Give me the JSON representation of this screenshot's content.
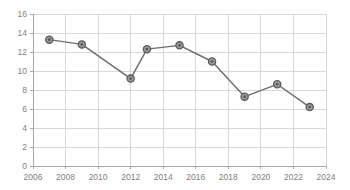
{
  "chart_data": {
    "type": "line",
    "title": "",
    "subtitle": "",
    "xlabel": "",
    "ylabel": "",
    "xlim": [
      2006,
      2024
    ],
    "ylim": [
      0,
      16
    ],
    "grid": true,
    "legend": null,
    "legend_position": "none",
    "x_ticks": [
      "2006",
      "2008",
      "2010",
      "2012",
      "2014",
      "2016",
      "2018",
      "2020",
      "2022",
      "2024"
    ],
    "y_ticks": [
      "0",
      "2",
      "4",
      "6",
      "8",
      "10",
      "12",
      "14",
      "16"
    ],
    "x": [
      2007,
      2009,
      2012,
      2013,
      2015,
      2017,
      2019,
      2021,
      2023
    ],
    "values": [
      13.3,
      12.8,
      9.2,
      12.3,
      12.7,
      11.0,
      7.3,
      8.6,
      6.2
    ],
    "series": [
      {
        "name": "series-1",
        "x": [
          2007,
          2009,
          2012,
          2013,
          2015,
          2017,
          2019,
          2021,
          2023
        ],
        "values": [
          13.3,
          12.8,
          9.2,
          12.3,
          12.7,
          11.0,
          7.3,
          8.6,
          6.2
        ]
      }
    ],
    "annotations": [],
    "colors": {
      "line": "#6b6b6b",
      "marker_fill": "#9a9a9a",
      "marker_edge": "#5a5a5a",
      "marker_center": "#555555",
      "gridline": "#d0d0d0",
      "axis": "#a8a8a8",
      "tick_label": "#808080",
      "background": "#ffffff"
    }
  },
  "plot_geometry": {
    "left": 33,
    "right": 326,
    "top": 14,
    "bottom": 166
  }
}
